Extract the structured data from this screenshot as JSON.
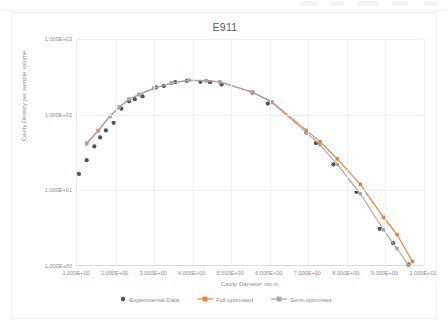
{
  "chart_data": {
    "type": "scatter",
    "title": "E911",
    "xlabel": "Cavity Dameter niu m",
    "ylabel": "Cavity Density per sample volume",
    "xscale": "linear",
    "yscale": "log",
    "xlim": [
      1,
      10
    ],
    "ylim": [
      1,
      1000
    ],
    "grid": true,
    "legend_position": "bottom",
    "xticks": [
      "1.000E+00",
      "2.000E+00",
      "3.000E+00",
      "4.000E+00",
      "5.000E+00",
      "6.000E+00",
      "7.000E+00",
      "8.000E+00",
      "9.000E+00",
      "1.000E+01"
    ],
    "xtick_values": [
      1,
      2,
      3,
      4,
      5,
      6,
      7,
      8,
      9,
      10
    ],
    "yticks": [
      "1.000E+00",
      "1.000E+01",
      "1.000E+02",
      "1.000E+03"
    ],
    "ytick_values": [
      1,
      10,
      100,
      1000
    ],
    "series": [
      {
        "name": "Experimental Data",
        "type": "scatter",
        "color": "#44546A",
        "marker": "circle",
        "points": [
          [
            1.05,
            16.5
          ],
          [
            1.25,
            25.0
          ],
          [
            1.45,
            38.0
          ],
          [
            1.6,
            50.0
          ],
          [
            1.75,
            62.0
          ],
          [
            1.95,
            78.0
          ],
          [
            2.15,
            120.0
          ],
          [
            2.35,
            150.0
          ],
          [
            2.5,
            160.0
          ],
          [
            2.7,
            175.0
          ],
          [
            3.05,
            230.0
          ],
          [
            3.25,
            240.0
          ],
          [
            3.55,
            270.0
          ],
          [
            3.85,
            280.0
          ],
          [
            4.2,
            272.0
          ],
          [
            4.45,
            268.0
          ],
          [
            4.75,
            250.0
          ],
          [
            5.55,
            195.0
          ],
          [
            5.95,
            140.0
          ],
          [
            6.95,
            58.0
          ],
          [
            7.2,
            42.0
          ],
          [
            7.65,
            22.0
          ],
          [
            8.25,
            9.5
          ],
          [
            8.85,
            3.1
          ],
          [
            9.2,
            2.0
          ],
          [
            9.6,
            1.05
          ]
        ]
      },
      {
        "name": "Full optimised",
        "type": "line",
        "color": "#ED7D31",
        "marker": "square",
        "points": [
          [
            1.25,
            42.0
          ],
          [
            1.55,
            62.0
          ],
          [
            1.85,
            95.0
          ],
          [
            2.1,
            128.0
          ],
          [
            2.35,
            160.0
          ],
          [
            2.6,
            185.0
          ],
          [
            3.0,
            225.0
          ],
          [
            3.45,
            262.0
          ],
          [
            3.9,
            285.0
          ],
          [
            4.35,
            282.0
          ],
          [
            4.7,
            272.0
          ],
          [
            5.55,
            200.0
          ],
          [
            6.05,
            148.0
          ],
          [
            6.95,
            62.0
          ],
          [
            7.3,
            44.0
          ],
          [
            7.75,
            26.0
          ],
          [
            8.35,
            12.0
          ],
          [
            8.95,
            4.4
          ],
          [
            9.3,
            2.6
          ],
          [
            9.7,
            1.15
          ]
        ]
      },
      {
        "name": "Semi-optimised",
        "type": "line",
        "color": "#A5A5A5",
        "marker": "square",
        "points": [
          [
            1.25,
            41.0
          ],
          [
            1.55,
            61.0
          ],
          [
            1.85,
            94.0
          ],
          [
            2.1,
            127.0
          ],
          [
            2.35,
            159.0
          ],
          [
            2.6,
            184.0
          ],
          [
            3.0,
            224.0
          ],
          [
            3.45,
            261.0
          ],
          [
            3.9,
            284.0
          ],
          [
            4.35,
            281.0
          ],
          [
            4.7,
            271.0
          ],
          [
            5.55,
            198.0
          ],
          [
            6.05,
            145.0
          ],
          [
            6.95,
            58.0
          ],
          [
            7.3,
            40.0
          ],
          [
            7.75,
            22.0
          ],
          [
            8.35,
            9.0
          ],
          [
            8.95,
            3.0
          ],
          [
            9.3,
            1.7
          ],
          [
            9.6,
            1.02
          ]
        ]
      }
    ]
  },
  "legend": {
    "items": [
      {
        "label": "Experimental Data",
        "color": "#44546A",
        "marker": "circle"
      },
      {
        "label": "Full optimised",
        "color": "#ED7D31",
        "marker": "line-square"
      },
      {
        "label": "Semi-optimised",
        "color": "#A5A5A5",
        "marker": "line-square"
      }
    ]
  }
}
